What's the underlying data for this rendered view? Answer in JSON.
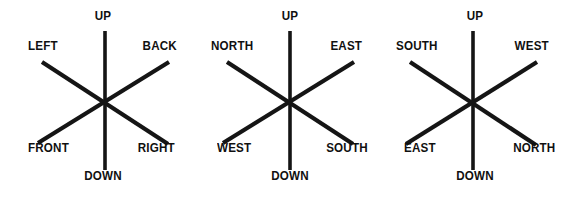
{
  "figure": {
    "background_color": "#ffffff",
    "ink_color": "#151515",
    "diagram_count": 3,
    "axis_scheme": "six-spoke: vertical up/down axis plus two diagonal axes"
  },
  "diagrams": [
    {
      "id": "diagram-1",
      "name": "body-relative-axes",
      "labels": {
        "up": "UP",
        "down": "DOWN",
        "upper_left": "LEFT",
        "upper_right": "BACK",
        "lower_left": "FRONT",
        "lower_right": "RIGHT"
      }
    },
    {
      "id": "diagram-2",
      "name": "cardinal-axes-variant-a",
      "labels": {
        "up": "UP",
        "down": "DOWN",
        "upper_left": "NORTH",
        "upper_right": "EAST",
        "lower_left": "WEST",
        "lower_right": "SOUTH"
      }
    },
    {
      "id": "diagram-3",
      "name": "cardinal-axes-variant-b",
      "labels": {
        "up": "UP",
        "down": "DOWN",
        "upper_left": "SOUTH",
        "upper_right": "WEST",
        "lower_left": "EAST",
        "lower_right": "NORTH"
      }
    }
  ]
}
